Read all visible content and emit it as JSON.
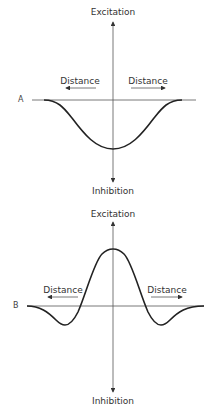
{
  "panels": [
    {
      "id": "A",
      "label": "A",
      "y_top_label": "Excitation",
      "y_bottom_label": "Inhibition",
      "left_label": "Distance",
      "right_label": "Distance"
    },
    {
      "id": "B",
      "label": "B",
      "y_top_label": "Excitation",
      "y_bottom_label": "Inhibition",
      "left_label": "Distance",
      "right_label": "Distance"
    }
  ],
  "colors": {
    "line": "#333333",
    "curve": "#222222"
  }
}
